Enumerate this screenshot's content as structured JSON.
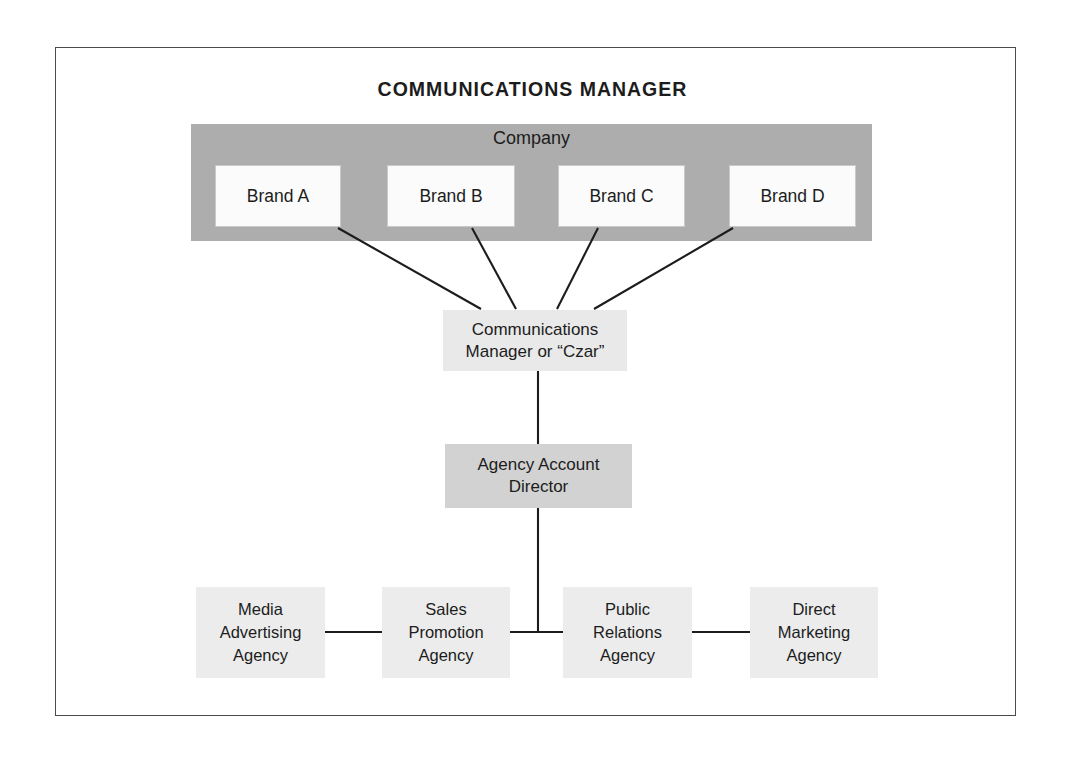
{
  "title": "COMMUNICATIONS MANAGER",
  "company": {
    "label": "Company",
    "brands": [
      {
        "id": "brand-a",
        "label": "Brand A"
      },
      {
        "id": "brand-b",
        "label": "Brand B"
      },
      {
        "id": "brand-c",
        "label": "Brand C"
      },
      {
        "id": "brand-d",
        "label": "Brand D"
      }
    ]
  },
  "czar": {
    "line1": "Communications",
    "line2": "Manager or “Czar”"
  },
  "director": {
    "line1": "Agency Account",
    "line2": "Director"
  },
  "agencies": [
    {
      "id": "agency-media",
      "line1": "Media",
      "line2": "Advertising",
      "line3": "Agency"
    },
    {
      "id": "agency-sales",
      "line1": "Sales",
      "line2": "Promotion",
      "line3": "Agency"
    },
    {
      "id": "agency-pr",
      "line1": "Public",
      "line2": "Relations",
      "line3": "Agency"
    },
    {
      "id": "agency-direct",
      "line1": "Direct",
      "line2": "Marketing",
      "line3": "Agency"
    }
  ],
  "colors": {
    "company_band": "#adadad",
    "brand_box": "#fbfbfb",
    "czar_box": "#e9e9e9",
    "director_box": "#d2d2d2",
    "agency_box": "#ececec",
    "line": "#1c1c1c",
    "frame": "#4a4a4a",
    "text": "#1c1c1c"
  }
}
